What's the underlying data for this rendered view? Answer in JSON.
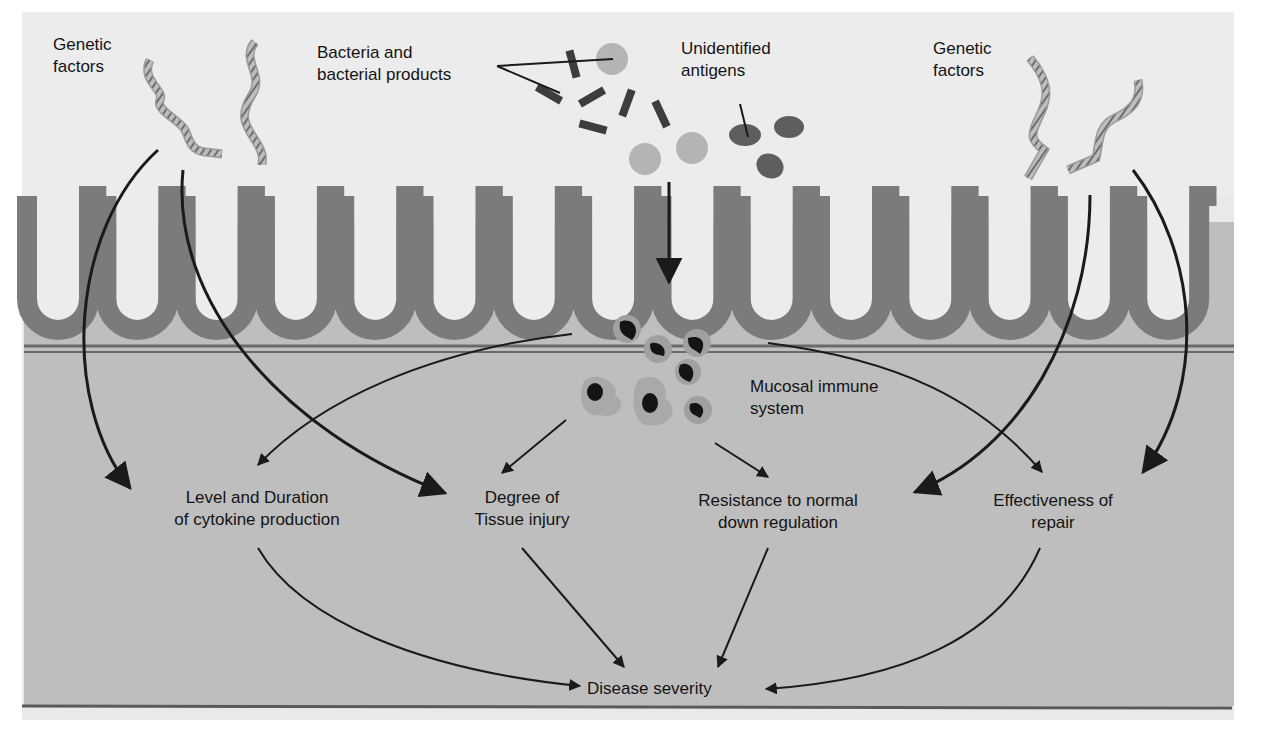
{
  "diagram": {
    "title": "",
    "colors": {
      "background": "#e9e9e9",
      "lumen": "#ececec",
      "epithelium": "#7b7b7b",
      "lamina_propria": "#bdbdbd",
      "tissue_lower": "#b9b9b9",
      "arrow": "#1a1a1a",
      "bacteria_rod": "#3d3d3d",
      "bacteria_sphere": "#b5b5b5",
      "antigen": "#5e5e5e"
    },
    "inputs": {
      "genetic_left": {
        "line1": "Genetic",
        "line2": "factors"
      },
      "bacteria": {
        "line1": "Bacteria and",
        "line2": "bacterial products"
      },
      "antigens": {
        "line1": "Unidentified",
        "line2": "antigens"
      },
      "genetic_right": {
        "line1": "Genetic",
        "line2": "factors"
      }
    },
    "center": {
      "line1": "Mucosal immune",
      "line2": "system"
    },
    "outcomes": [
      {
        "line1": "Level and Duration",
        "line2": "of cytokine production"
      },
      {
        "line1": "Degree of",
        "line2": "Tissue injury"
      },
      {
        "line1": "Resistance to normal",
        "line2": "down regulation"
      },
      {
        "line1": "Effectiveness of",
        "line2": "repair"
      }
    ],
    "result": {
      "label": "Disease severity"
    },
    "icons": {
      "dna_left_a": "dna-helix-icon",
      "dna_left_b": "dna-helix-icon",
      "dna_right_a": "dna-helix-icon",
      "dna_right_b": "dna-helix-icon",
      "bacteria": "bacteria-rod-icon",
      "antigens": "antigen-oval-icon",
      "immune_cells": "immune-cell-icon"
    }
  }
}
